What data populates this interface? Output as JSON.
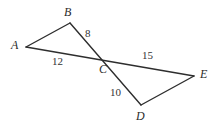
{
  "figure": {
    "background_color": "#ffffff",
    "stroke_color": "#2e2e2e",
    "label_color": "#2b2b2b",
    "stroke_width": 1.4,
    "width": 217,
    "height": 127
  },
  "vertices": [
    {
      "id": "A",
      "label": "A",
      "x": 26,
      "y": 47,
      "label_x": 11,
      "label_y": 39
    },
    {
      "id": "B",
      "label": "B",
      "x": 70,
      "y": 23,
      "label_x": 64,
      "label_y": 6
    },
    {
      "id": "C",
      "label": "C",
      "x": 106,
      "y": 59,
      "label_x": 99,
      "label_y": 63
    },
    {
      "id": "D",
      "label": "D",
      "x": 141,
      "y": 105,
      "label_x": 136,
      "label_y": 110
    },
    {
      "id": "E",
      "label": "E",
      "x": 194,
      "y": 76,
      "label_x": 200,
      "label_y": 68
    }
  ],
  "segments": [
    {
      "id": "AB",
      "from": "A",
      "to": "B",
      "x1": 26,
      "y1": 47,
      "x2": 70,
      "y2": 23
    },
    {
      "id": "BD",
      "from": "B",
      "to": "D",
      "x1": 70,
      "y1": 23,
      "x2": 141,
      "y2": 105
    },
    {
      "id": "AE",
      "from": "A",
      "to": "E",
      "x1": 26,
      "y1": 47,
      "x2": 194,
      "y2": 76
    },
    {
      "id": "DE",
      "from": "D",
      "to": "E",
      "x1": 141,
      "y1": 105,
      "x2": 194,
      "y2": 76
    }
  ],
  "measurements": [
    {
      "id": "BC",
      "value": "8",
      "x": 85,
      "y": 28
    },
    {
      "id": "AC",
      "value": "12",
      "x": 52,
      "y": 56
    },
    {
      "id": "CE",
      "value": "15",
      "x": 142,
      "y": 50
    },
    {
      "id": "CD",
      "value": "10",
      "x": 110,
      "y": 87
    }
  ]
}
